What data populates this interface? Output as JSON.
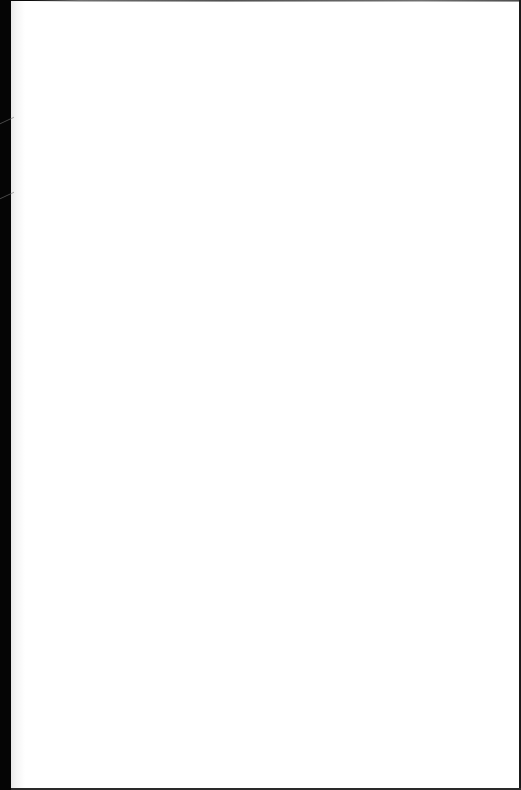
{
  "page": {
    "content": "",
    "background_color": "#ffffff",
    "border_color": "#050505"
  }
}
